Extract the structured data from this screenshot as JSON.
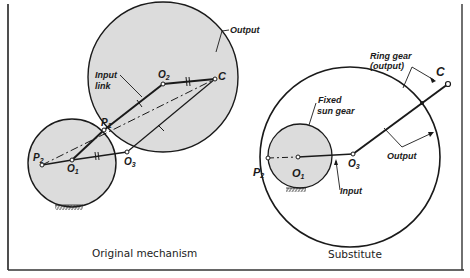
{
  "figure": {
    "left_panel": {
      "caption": "Original mechanism",
      "labels": {
        "output": "Output",
        "input_link_1": "Input",
        "input_link_2": "link",
        "o1": "O",
        "o1_sub": "1",
        "o2": "O",
        "o2_sub": "2",
        "o3": "O",
        "o3_sub": "3",
        "c": "C",
        "p1": "P",
        "p1_sub": "1",
        "p2": "P",
        "p2_sub": "2"
      }
    },
    "right_panel": {
      "caption": "Substitute",
      "labels": {
        "ring_gear_1": "Ring gear",
        "ring_gear_2": "(output)",
        "c": "C",
        "fixed_1": "Fixed",
        "fixed_2": "sun gear",
        "o1": "O",
        "o1_sub": "1",
        "o3": "O",
        "o3_sub": "3",
        "p2": "P",
        "p2_sub": "2",
        "input": "Input",
        "output": "Output"
      }
    },
    "colors": {
      "gear_fill": "#dcdcdc",
      "line": "#1a1a1a"
    }
  }
}
